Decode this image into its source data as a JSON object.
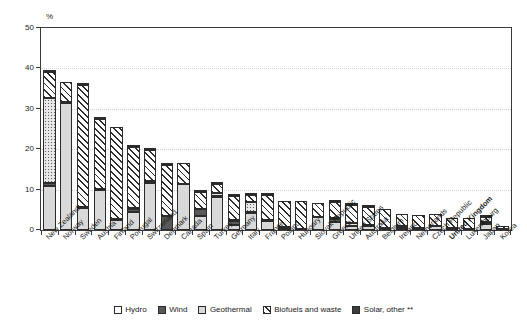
{
  "chart_data": {
    "type": "bar",
    "stacked": true,
    "title": "",
    "subtitle": "",
    "xlabel": "",
    "ylabel": "%",
    "ylim": [
      0,
      50
    ],
    "yticks": [
      0,
      10,
      20,
      30,
      40,
      50
    ],
    "grid": true,
    "legend_position": "bottom",
    "categories": [
      "New Zealand",
      "Norway",
      "Sweden",
      "Austria",
      "Finland",
      "Portugal",
      "Switzerland",
      "Denmark",
      "Canada",
      "Spain",
      "Turkey",
      "Germany",
      "Italy",
      "France",
      "Poland",
      "Hungary",
      "Slovak Republic",
      "Greece",
      "United States",
      "Australia",
      "Belgium",
      "Ireland",
      "Netherlands",
      "Czech Republic",
      "United Kingdom",
      "Luxembourg",
      "Japan",
      "Korea"
    ],
    "highlighted_category": "United Kingdom",
    "series": [
      {
        "name": "Hydro",
        "pattern": "open",
        "values": [
          11.0,
          31.5,
          5.5,
          9.8,
          2.6,
          4.4,
          11.7,
          0.0,
          11.3,
          3.5,
          8.2,
          1.2,
          4.3,
          2.2,
          0.6,
          0.3,
          3.3,
          2.1,
          1.0,
          1.1,
          0.2,
          0.4,
          0.1,
          0.9,
          0.2,
          0.1,
          1.5,
          0.2
        ]
      },
      {
        "name": "Wind",
        "pattern": "solid-dark",
        "values": [
          0.7,
          0.2,
          0.3,
          0.3,
          0.2,
          0.9,
          0.1,
          3.5,
          0.1,
          1.7,
          0.1,
          1.1,
          0.1,
          0.2,
          0.1,
          0.0,
          0.0,
          0.6,
          0.1,
          0.1,
          0.2,
          0.7,
          0.3,
          0.2,
          0.3,
          0.1,
          0.0,
          0.0
        ]
      },
      {
        "name": "Geothermal",
        "pattern": "light-grey",
        "values": [
          20.9,
          0.0,
          0.0,
          0.0,
          0.0,
          0.2,
          0.3,
          0.0,
          0.0,
          0.0,
          0.8,
          0.1,
          2.5,
          0.1,
          0.0,
          0.0,
          0.0,
          0.2,
          0.6,
          0.1,
          0.0,
          0.0,
          0.0,
          0.0,
          0.0,
          0.0,
          0.5,
          0.0
        ]
      },
      {
        "name": "Biofuels and waste",
        "pattern": "diagonal-hatch",
        "values": [
          6.6,
          4.9,
          30.1,
          17.4,
          22.7,
          15.1,
          7.8,
          12.7,
          5.1,
          4.2,
          2.4,
          6.1,
          1.7,
          6.2,
          6.6,
          7.0,
          3.5,
          4.0,
          4.6,
          4.4,
          4.8,
          2.9,
          3.4,
          2.9,
          2.4,
          2.8,
          1.2,
          0.9
        ]
      },
      {
        "name": "Solar, other **",
        "pattern": "solid-dark",
        "values": [
          0.1,
          0.0,
          0.1,
          0.2,
          0.0,
          0.1,
          0.2,
          0.1,
          0.0,
          0.2,
          0.1,
          0.2,
          0.1,
          0.1,
          0.0,
          0.0,
          0.0,
          0.3,
          0.1,
          0.2,
          0.0,
          0.0,
          0.0,
          0.0,
          0.0,
          0.0,
          0.1,
          0.0
        ]
      }
    ],
    "totals": [
      39.3,
      36.6,
      36.0,
      27.7,
      25.5,
      20.7,
      20.1,
      16.3,
      16.5,
      9.6,
      11.6,
      8.7,
      8.7,
      8.8,
      7.3,
      7.3,
      6.8,
      7.2,
      6.4,
      5.9,
      5.2,
      4.0,
      3.8,
      4.0,
      2.9,
      3.0,
      3.3,
      1.1
    ]
  },
  "axis": {
    "y_unit_label": "%",
    "y_tick_labels": [
      "50",
      "40",
      "30",
      "20",
      "10",
      "0"
    ]
  },
  "legend": {
    "items": [
      {
        "label": "Hydro",
        "swatch": "open-square-swatch"
      },
      {
        "label": "Wind",
        "swatch": "dark-square-swatch"
      },
      {
        "label": "Geothermal",
        "swatch": "light-grey-square-swatch"
      },
      {
        "label": "Biofuels and waste",
        "swatch": "hatched-square-swatch"
      },
      {
        "label": "Solar, other **",
        "swatch": "dark-square-swatch"
      }
    ]
  },
  "colors": {
    "hydro": "#ffffff",
    "wind": "#595959",
    "geothermal": "#d9d9d9",
    "biofuels": "#2b2b2b",
    "solar": "#3d3d3d",
    "axis": "#3a3a3a",
    "grid": "#d2d2d2"
  }
}
